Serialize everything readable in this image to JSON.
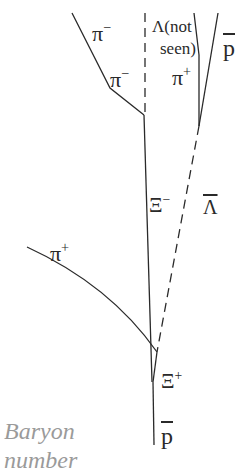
{
  "diagram": {
    "tracks": [
      {
        "name": "pi-minus-track",
        "style": "solid",
        "points": [
          [
            72,
            13
          ],
          [
            110,
            88
          ],
          [
            144,
            115
          ]
        ]
      },
      {
        "name": "lambda-track",
        "style": "dashed",
        "points": [
          [
            145,
            13
          ],
          [
            145,
            115
          ]
        ]
      },
      {
        "name": "xi-minus-track",
        "style": "solid",
        "points": [
          [
            144,
            115
          ],
          [
            152,
            382
          ]
        ]
      },
      {
        "name": "pi-plus-upper-track",
        "style": "solid",
        "points": [
          [
            194,
            13
          ],
          [
            199,
            55
          ],
          [
            199,
            126
          ]
        ]
      },
      {
        "name": "pbar-upper-track",
        "style": "solid",
        "points": [
          [
            218,
            13
          ],
          [
            199,
            126
          ]
        ]
      },
      {
        "name": "lambda-bar-track",
        "style": "dashed",
        "points": [
          [
            199,
            126
          ],
          [
            157,
            352
          ]
        ]
      },
      {
        "name": "pi-plus-lower-track",
        "style": "solid",
        "points": [
          [
            27,
            247
          ],
          [
            157,
            352
          ]
        ]
      },
      {
        "name": "xi-plus-track",
        "style": "solid",
        "points": [
          [
            157,
            352
          ],
          [
            153,
            382
          ]
        ]
      },
      {
        "name": "pbar-lower-track",
        "style": "solid",
        "points": [
          [
            153,
            382
          ],
          [
            154,
            445
          ]
        ]
      }
    ],
    "labels": {
      "pi_minus_top": {
        "base": "π",
        "sup": "−"
      },
      "pi_minus_mid": {
        "base": "π",
        "sup": "−"
      },
      "lambda_not_seen_line1": "Λ(not",
      "lambda_not_seen_line2": "seen)",
      "pi_plus_top": {
        "base": "π",
        "sup": "+"
      },
      "pbar_top": "p",
      "xi_minus": {
        "base": "Ξ",
        "sup": "−"
      },
      "lambda_bar": "Λ",
      "pi_plus_lower": {
        "base": "π",
        "sup": "+"
      },
      "xi_plus": {
        "base": "Ξ",
        "sup": "+"
      },
      "pbar_bottom": "p"
    },
    "caption": {
      "line1": "Baryon",
      "line2": "number"
    },
    "colors": {
      "track": "#2a2a2a",
      "caption": "#9a9a9a",
      "background": "#ffffff"
    }
  }
}
